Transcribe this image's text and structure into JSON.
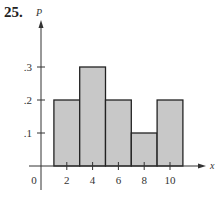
{
  "problem_number": "25.",
  "chart_data": {
    "type": "bar",
    "title": "",
    "xlabel": "x",
    "ylabel": "P",
    "categories": [
      "2",
      "4",
      "6",
      "8",
      "10"
    ],
    "x": [
      2,
      4,
      6,
      8,
      10
    ],
    "values": [
      0.2,
      0.3,
      0.2,
      0.1,
      0.2
    ],
    "bar_width": 2,
    "x_ticks": [
      "2",
      "4",
      "6",
      "8",
      "10"
    ],
    "y_ticks": [
      ".1",
      ".2",
      ".3"
    ],
    "origin_label": "0",
    "ylim": [
      0,
      0.4
    ],
    "xlim": [
      0,
      12
    ],
    "grid": false,
    "legend": null,
    "bar_fill": "#c8c8c8",
    "bar_edge": "#222222"
  }
}
